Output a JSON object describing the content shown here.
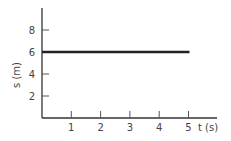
{
  "chart_data": {
    "type": "line",
    "title": "",
    "xlabel": "t (s)",
    "ylabel": "s (m)",
    "x_ticks": [
      "1",
      "2",
      "3",
      "4",
      "5"
    ],
    "y_ticks": [
      "2",
      "4",
      "6",
      "8"
    ],
    "xlim": [
      0,
      6
    ],
    "ylim": [
      0,
      10
    ],
    "grid": false,
    "series": [
      {
        "name": "position",
        "x": [
          0,
          5
        ],
        "y": [
          6,
          6
        ]
      }
    ]
  }
}
